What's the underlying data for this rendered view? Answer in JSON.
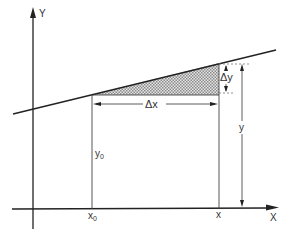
{
  "diagram": {
    "axes": {
      "x_label": "X",
      "y_label": "Y"
    },
    "labels": {
      "x0": "x",
      "x0_sub": "0",
      "y0": "y",
      "y0_sub": "0",
      "x": "x",
      "y": "y",
      "delta_x": "Δx",
      "delta_y": "Δy"
    },
    "colors": {
      "line": "#222222",
      "shade": "#bbbbbb",
      "dashed": "#777777",
      "background": "#ffffff"
    }
  }
}
